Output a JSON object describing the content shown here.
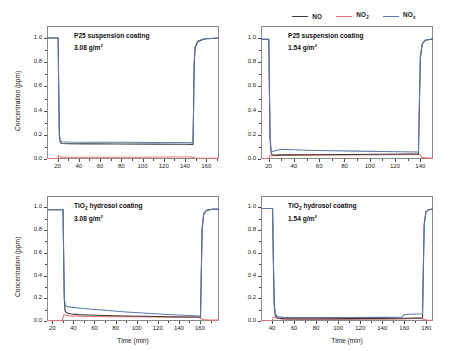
{
  "figure": {
    "axis_y_label": "Concentration (ppm)",
    "axis_x_label": "Time (min)"
  },
  "legend": {
    "position": "top-right",
    "items": [
      {
        "name": "NO",
        "label": "NO",
        "sub": "",
        "color": "#3a3a3a"
      },
      {
        "name": "NO2",
        "label": "NO",
        "sub": "2",
        "color": "#e8736e"
      },
      {
        "name": "NOx",
        "label": "NO",
        "sub": "x",
        "color": "#5f79ad"
      }
    ]
  },
  "colors": {
    "no": "#3a3a3a",
    "no2": "#e8736e",
    "nox": "#5f79ad",
    "axis": "#8a8a8a",
    "text": "#1a1a1a"
  },
  "chart_data": [
    {
      "panel": "top-left",
      "type": "line",
      "title_line1": "P25 suspension coating",
      "title_line2_value": "3.08",
      "title_line2_unit": "g/m",
      "title_line2_sup": "2",
      "xlabel": "Time (min)",
      "ylabel": "Concentration (ppm)",
      "xlim": [
        10,
        172
      ],
      "ylim": [
        0.0,
        1.1
      ],
      "xticks": [
        20,
        40,
        60,
        80,
        100,
        120,
        140,
        160
      ],
      "yticks": [
        0.0,
        0.2,
        0.4,
        0.6,
        0.8,
        1.0
      ],
      "ytick_labels": [
        "0.0",
        "0.2",
        "0.4",
        "0.6",
        "0.8",
        "1.0"
      ],
      "grid": false,
      "series": [
        {
          "name": "NOx",
          "color": "#5f79ad",
          "x": [
            10,
            20.5,
            21.0,
            21.6,
            22.4,
            24,
            30,
            50,
            80,
            110,
            140,
            147.5,
            148.0,
            148.6,
            149.5,
            152,
            158,
            172
          ],
          "y": [
            1.0,
            1.0,
            0.6,
            0.22,
            0.155,
            0.142,
            0.14,
            0.139,
            0.138,
            0.137,
            0.136,
            0.135,
            0.4,
            0.8,
            0.93,
            0.975,
            0.995,
            1.0
          ]
        },
        {
          "name": "NO",
          "color": "#3a3a3a",
          "x": [
            10,
            20.5,
            21.0,
            21.6,
            22.4,
            24,
            30,
            50,
            80,
            110,
            140,
            147.5,
            148.0,
            148.6,
            149.5,
            152,
            158,
            172
          ],
          "y": [
            1.0,
            1.0,
            0.58,
            0.2,
            0.138,
            0.128,
            0.126,
            0.125,
            0.124,
            0.123,
            0.122,
            0.121,
            0.38,
            0.78,
            0.92,
            0.97,
            0.992,
            1.0
          ]
        },
        {
          "name": "NO2",
          "color": "#e8736e",
          "x": [
            10,
            20.0,
            21.0,
            21.5,
            22.5,
            25,
            40,
            70,
            100,
            130,
            146,
            148.0,
            150,
            160,
            172
          ],
          "y": [
            0.005,
            0.005,
            0.03,
            0.022,
            0.015,
            0.014,
            0.014,
            0.015,
            0.015,
            0.016,
            0.016,
            0.012,
            0.008,
            0.007,
            0.007
          ]
        }
      ]
    },
    {
      "panel": "top-right",
      "type": "line",
      "title_line1": "P25 suspension coating",
      "title_line2_value": "1.54",
      "title_line2_unit": "g/m",
      "title_line2_sup": "2",
      "xlabel": "Time (min)",
      "ylabel": "Concentration (ppm)",
      "xlim": [
        14,
        150
      ],
      "ylim": [
        0.0,
        1.1
      ],
      "xticks": [
        20,
        40,
        60,
        80,
        100,
        120,
        140
      ],
      "yticks": [
        0.0,
        0.2,
        0.4,
        0.6,
        0.8,
        1.0
      ],
      "ytick_labels": [
        "0.0",
        "0.2",
        "0.4",
        "0.6",
        "0.8",
        "1.0"
      ],
      "grid": false,
      "series": [
        {
          "name": "NOx",
          "color": "#5f79ad",
          "x": [
            14,
            20.2,
            20.7,
            21.2,
            22.0,
            23,
            26,
            30,
            36,
            50,
            70,
            90,
            110,
            125,
            138.5,
            139.2,
            140.0,
            141.5,
            144,
            150
          ],
          "y": [
            0.99,
            0.99,
            0.55,
            0.18,
            0.075,
            0.062,
            0.07,
            0.08,
            0.078,
            0.072,
            0.068,
            0.065,
            0.062,
            0.06,
            0.058,
            0.45,
            0.85,
            0.955,
            0.985,
            0.995
          ]
        },
        {
          "name": "NO",
          "color": "#3a3a3a",
          "x": [
            14,
            20.2,
            20.7,
            21.2,
            22.0,
            23,
            26,
            32,
            50,
            80,
            110,
            130,
            138.5,
            139.2,
            140.0,
            141.5,
            144,
            150
          ],
          "y": [
            0.99,
            0.99,
            0.52,
            0.16,
            0.05,
            0.035,
            0.032,
            0.034,
            0.036,
            0.038,
            0.04,
            0.041,
            0.042,
            0.42,
            0.83,
            0.95,
            0.982,
            0.993
          ]
        },
        {
          "name": "NO2",
          "color": "#e8736e",
          "x": [
            14,
            20.0,
            21.0,
            21.6,
            23,
            30,
            50,
            80,
            110,
            132,
            139.5,
            141,
            145,
            150
          ],
          "y": [
            0.004,
            0.004,
            0.026,
            0.03,
            0.028,
            0.03,
            0.032,
            0.034,
            0.036,
            0.038,
            0.038,
            0.014,
            0.008,
            0.007
          ]
        }
      ]
    },
    {
      "panel": "bottom-left",
      "type": "line",
      "title_line1_prefix": "TiO",
      "title_line1_sub": "2",
      "title_line1_suffix": " hydrosol coating",
      "title_line2_value": "3.08",
      "title_line2_unit": "g/m",
      "title_line2_sup": "2",
      "xlabel": "Time (min)",
      "ylabel": "Concentration (ppm)",
      "xlim": [
        15,
        178
      ],
      "ylim": [
        0.0,
        1.1
      ],
      "xticks": [
        20,
        40,
        60,
        80,
        100,
        120,
        140,
        160
      ],
      "yticks": [
        0.0,
        0.2,
        0.4,
        0.6,
        0.8,
        1.0
      ],
      "ytick_labels": [
        "0.0",
        "0.2",
        "0.4",
        "0.6",
        "0.8",
        "1.0"
      ],
      "grid": false,
      "series": [
        {
          "name": "NOx",
          "color": "#5f79ad",
          "x": [
            15,
            30.2,
            30.8,
            31.4,
            32.2,
            34,
            38,
            45,
            55,
            70,
            90,
            110,
            130,
            150,
            160.5,
            161.2,
            162.0,
            163.5,
            166,
            172,
            178
          ],
          "y": [
            0.98,
            0.98,
            0.58,
            0.22,
            0.135,
            0.128,
            0.122,
            0.115,
            0.106,
            0.094,
            0.08,
            0.068,
            0.058,
            0.048,
            0.044,
            0.42,
            0.82,
            0.945,
            0.975,
            0.985,
            0.985
          ]
        },
        {
          "name": "NO",
          "color": "#3a3a3a",
          "x": [
            15,
            30.2,
            30.8,
            31.4,
            32.2,
            34,
            38,
            45,
            55,
            70,
            90,
            110,
            130,
            150,
            160.5,
            161.2,
            162.0,
            163.5,
            166,
            172,
            178
          ],
          "y": [
            0.98,
            0.98,
            0.55,
            0.18,
            0.085,
            0.07,
            0.062,
            0.056,
            0.052,
            0.048,
            0.044,
            0.041,
            0.038,
            0.036,
            0.035,
            0.4,
            0.8,
            0.94,
            0.972,
            0.983,
            0.983
          ]
        },
        {
          "name": "NO2",
          "color": "#e8736e",
          "x": [
            15,
            29.5,
            30.5,
            31.2,
            32.5,
            36,
            45,
            60,
            80,
            110,
            140,
            158,
            161.5,
            164,
            170,
            178
          ],
          "y": [
            0.004,
            0.004,
            0.048,
            0.055,
            0.05,
            0.045,
            0.042,
            0.04,
            0.038,
            0.036,
            0.034,
            0.033,
            0.02,
            0.01,
            0.008,
            0.008
          ]
        }
      ]
    },
    {
      "panel": "bottom-right",
      "type": "line",
      "title_line1_prefix": "TiO",
      "title_line1_sub": "2",
      "title_line1_suffix": " hydrosol coating",
      "title_line2_value": "1.54",
      "title_line2_unit": "g/m",
      "title_line2_sup": "2",
      "xlabel": "Time (min)",
      "ylabel": "Concentration (ppm)",
      "xlim": [
        30,
        186
      ],
      "ylim": [
        0.0,
        1.1
      ],
      "xticks": [
        40,
        60,
        80,
        100,
        120,
        140,
        160,
        180
      ],
      "yticks": [
        0.0,
        0.2,
        0.4,
        0.6,
        0.8,
        1.0
      ],
      "ytick_labels": [
        "0.0",
        "0.2",
        "0.4",
        "0.6",
        "0.8",
        "1.0"
      ],
      "grid": false,
      "series": [
        {
          "name": "NOx",
          "color": "#5f79ad",
          "x": [
            30,
            40.5,
            41.2,
            42.0,
            43,
            45,
            50,
            60,
            80,
            110,
            140,
            158,
            160,
            165,
            172,
            176.5,
            177.2,
            178.0,
            179.5,
            182,
            186
          ],
          "y": [
            0.99,
            0.99,
            0.55,
            0.16,
            0.06,
            0.038,
            0.032,
            0.03,
            0.03,
            0.031,
            0.032,
            0.034,
            0.058,
            0.06,
            0.062,
            0.064,
            0.45,
            0.86,
            0.96,
            0.982,
            0.985
          ]
        },
        {
          "name": "NO",
          "color": "#3a3a3a",
          "x": [
            30,
            40.5,
            41.2,
            42.0,
            43,
            45,
            50,
            60,
            80,
            110,
            140,
            160,
            172,
            176.5,
            177.2,
            178.0,
            179.5,
            182,
            186
          ],
          "y": [
            0.99,
            0.99,
            0.52,
            0.14,
            0.045,
            0.026,
            0.021,
            0.02,
            0.02,
            0.021,
            0.022,
            0.024,
            0.026,
            0.027,
            0.43,
            0.84,
            0.955,
            0.98,
            0.983
          ]
        },
        {
          "name": "NO2",
          "color": "#e8736e",
          "x": [
            30,
            40.0,
            41.0,
            41.8,
            43,
            48,
            60,
            90,
            120,
            150,
            165,
            174,
            177.5,
            180,
            186
          ],
          "y": [
            0.003,
            0.003,
            0.03,
            0.034,
            0.028,
            0.018,
            0.014,
            0.014,
            0.015,
            0.016,
            0.02,
            0.024,
            0.016,
            0.008,
            0.007
          ]
        }
      ]
    }
  ]
}
